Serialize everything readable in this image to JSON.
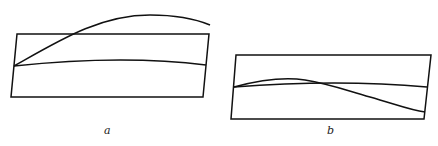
{
  "figures": [
    {
      "id": "a",
      "label": "a"
    },
    {
      "id": "b",
      "label": "b"
    }
  ],
  "colors": {
    "stroke": "#111111",
    "background": "#ffffff"
  }
}
